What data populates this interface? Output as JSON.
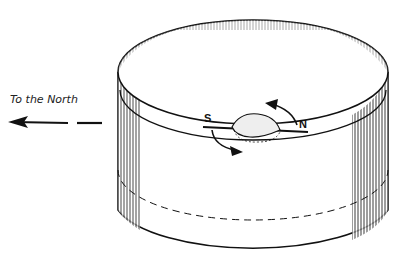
{
  "diagram": {
    "direction_label": "To the North",
    "needle": {
      "south_label": "S",
      "north_label": "N"
    },
    "colors": {
      "ink": "#111111",
      "background": "#ffffff",
      "shade": "#555555"
    }
  }
}
